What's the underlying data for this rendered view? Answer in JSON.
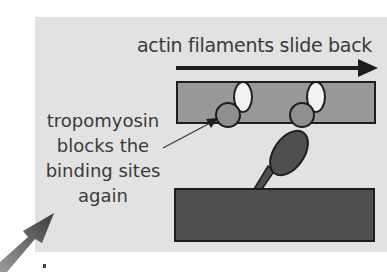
{
  "diagram": {
    "title": "actin filaments slide back",
    "annotation_lines": [
      "tropomyosin",
      "blocks the",
      "binding sites",
      "again"
    ],
    "colors": {
      "panel_bg": "#e2e2e2",
      "actin_fill": "#999999",
      "myosin_fill": "#4f4f4f",
      "tropomyosin_fill": "#8f8f8f",
      "binding_site_fill": "#f2f2f2",
      "outline": "#1e1e1e"
    }
  }
}
